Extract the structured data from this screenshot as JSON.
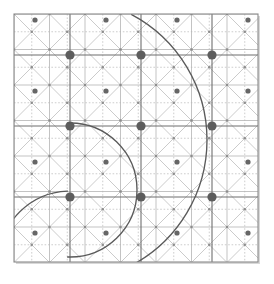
{
  "figure": {
    "background_color": "#ffffff",
    "paper_color": "#ffffff"
  },
  "canvas": {
    "width": 274,
    "height": 284
  },
  "sheet": {
    "name": "grid-sheet",
    "x": 14,
    "y": 14,
    "width": 244,
    "height": 248,
    "border_color": "#8a8a8a",
    "border_width": 1.1,
    "shadow_color": "#d8d8d8"
  },
  "grid": {
    "origin_x": 14,
    "origin_y": 14,
    "major_spacing": 71,
    "minor_spacing": 35.5,
    "major_columns": 4,
    "major_rows": 4,
    "major_line_color": "#6f6f6f",
    "major_line_width": 1.1,
    "minor_line_color": "#b4b4b4",
    "minor_line_width": 0.8,
    "diagonal_color": "#c2c2c2",
    "diagonal_width": 0.85,
    "dotted_color": "#b9b9b9",
    "dotted_width": 0.7,
    "dotted_dash": "1.6 1.8"
  },
  "dots": {
    "major": {
      "name": "major-lattice-dot",
      "radius": 4.6,
      "color": "#5d5d5d",
      "spacing": 71,
      "count_x": 3,
      "count_y": 3,
      "first_x": 70,
      "first_y": 55
    },
    "medium": {
      "name": "medium-lattice-dot",
      "radius": 2.6,
      "color": "#666666",
      "spacing": 71,
      "first_x": 106,
      "first_y": 91
    },
    "small": {
      "name": "minor-lattice-dot",
      "radius": 1.25,
      "color": "#8d8d8d"
    }
  },
  "chart_data": {
    "type": "scatter",
    "xlabel": "",
    "ylabel": "",
    "grid": true,
    "legend": false,
    "xlim": [
      14,
      258
    ],
    "ylim": [
      14,
      262
    ],
    "arcs": [
      {
        "name": "large-arc",
        "center_x": 65,
        "center_y": 140,
        "radius": 142,
        "stroke": "#5a5a5a",
        "stroke_width": 1.35,
        "start_angle_deg": -58,
        "end_angle_deg": 58,
        "description": "Large arc bulging to the right; rightmost point near x=207, y=140"
      },
      {
        "name": "small-arc",
        "center_x": 70,
        "center_y": 190,
        "radius": 67,
        "stroke": "#5a5a5a",
        "stroke_width": 1.35,
        "start_angle_deg": -90,
        "end_angle_deg": 90,
        "description": "Smaller arc tangent at major dot (70,126), rightmost near x=138, y=190"
      },
      {
        "name": "tail-arc",
        "center_x": 70,
        "center_y": 262,
        "radius": 71,
        "stroke": "#5a5a5a",
        "stroke_width": 1.2,
        "description": "Lower sweeping tail meeting the bottom-left of the sheet"
      }
    ],
    "key_points": [
      {
        "label": "top entry of large arc",
        "x": 149,
        "y": 14
      },
      {
        "label": "arc tangency at major dot",
        "x": 70,
        "y": 126
      },
      {
        "label": "large arc rightmost",
        "x": 207,
        "y": 140
      },
      {
        "label": "small arc rightmost",
        "x": 138,
        "y": 190
      },
      {
        "label": "bottom convergence",
        "x": 85,
        "y": 262
      }
    ]
  }
}
